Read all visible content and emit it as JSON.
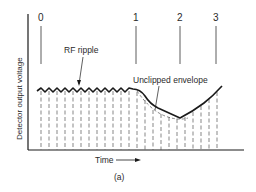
{
  "diagram": {
    "type": "waveform",
    "caption": "(a)",
    "y_axis_label": "Detector output voltage",
    "x_axis_label": "Time",
    "markers": [
      {
        "label": "0",
        "x": 41
      },
      {
        "label": "1",
        "x": 136
      },
      {
        "label": "2",
        "x": 180
      },
      {
        "label": "3",
        "x": 216
      }
    ],
    "annotations": {
      "rf_ripple": "RF ripple",
      "unclipped_envelope": "Unclipped envelope"
    },
    "colors": {
      "line": "#1a1a1a",
      "dashed": "#555555",
      "background": "#ffffff"
    }
  }
}
